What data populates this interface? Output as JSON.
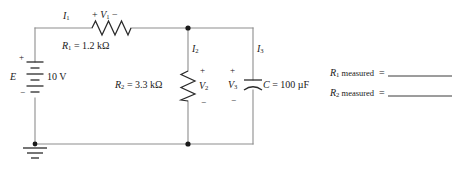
{
  "figure": {
    "type": "circuit-schematic"
  },
  "source": {
    "symbol_label": "E",
    "value": "10 V",
    "plus_sign": "+",
    "minus_sign": "−",
    "ground": "ground-symbol"
  },
  "components": {
    "r1": {
      "name": "R",
      "subscript": "1",
      "equals": "=",
      "value": "1.2 kΩ",
      "label": "R₁ = 1.2 kΩ",
      "orientation": "horizontal"
    },
    "r2": {
      "name": "R",
      "subscript": "2",
      "equals": "=",
      "value": "3.3 kΩ",
      "label": "R₂ = 3.3 kΩ",
      "orientation": "vertical"
    },
    "c": {
      "name": "C",
      "equals": "=",
      "value": "100 µF",
      "label": "C = 100 µF",
      "orientation": "vertical"
    }
  },
  "currents": [
    {
      "name": "I",
      "subscript": "1",
      "label": "I₁"
    },
    {
      "name": "I",
      "subscript": "2",
      "label": "I₂"
    },
    {
      "name": "I",
      "subscript": "3",
      "label": "I₃"
    }
  ],
  "voltages": [
    {
      "name": "V",
      "subscript": "1",
      "label": "V₁",
      "plus": "+",
      "minus": "−"
    },
    {
      "name": "V",
      "subscript": "2",
      "label": "V₂",
      "plus": "+",
      "minus": "−"
    },
    {
      "name": "V",
      "subscript": "3",
      "label": "V₃",
      "plus": "+",
      "minus": "−"
    }
  ],
  "measurements": [
    {
      "name": "R",
      "subscript": "1",
      "word": "measured",
      "equals": "=",
      "value": ""
    },
    {
      "name": "R",
      "subscript": "2",
      "word": "measured",
      "equals": "=",
      "value": ""
    }
  ],
  "colors": {
    "wire": "#8d8d8d",
    "ink": "#1a1a1a",
    "background": "#ffffff"
  }
}
